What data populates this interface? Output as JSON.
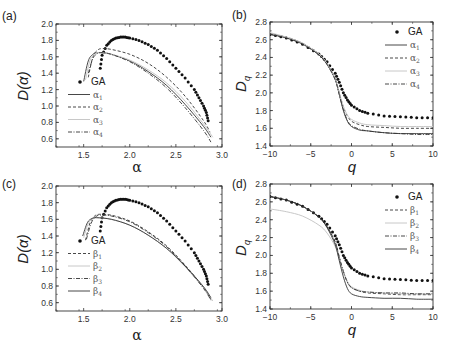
{
  "figure": {
    "panels": [
      {
        "id": "a",
        "label": "(a)",
        "ylabel": "D(α)",
        "xlabel": "α"
      },
      {
        "id": "b",
        "label": "(b)",
        "ylabel": "D",
        "ylabel_sub": "q",
        "xlabel": "q"
      },
      {
        "id": "c",
        "label": "(c)",
        "ylabel": "D(α)",
        "xlabel": "α"
      },
      {
        "id": "d",
        "label": "(d)",
        "ylabel": "D",
        "ylabel_sub": "q",
        "xlabel": "q"
      }
    ]
  },
  "chart_data": [
    {
      "panel": "(a)",
      "type": "line",
      "title": "",
      "xlabel": "α",
      "ylabel": "D(α)",
      "xlim": [
        1.2,
        3.0
      ],
      "ylim": [
        0.5,
        2.0
      ],
      "xticks": [
        "1.5",
        "2.0",
        "2.5",
        "3.0"
      ],
      "yticks": [
        "0.6",
        "0.8",
        "1.0",
        "1.2",
        "1.4",
        "1.6",
        "1.8",
        "2.0"
      ],
      "grid": false,
      "legend": [
        "GA",
        "α1",
        "α2",
        "α3",
        "α4"
      ],
      "legend_position": "lower left inside",
      "series": [
        {
          "name": "GA",
          "style": "dots",
          "x": [
            1.68,
            1.7,
            1.75,
            1.8,
            1.85,
            1.9,
            1.95,
            2.0,
            2.1,
            2.2,
            2.3,
            2.4,
            2.5,
            2.6,
            2.7,
            2.75,
            2.8,
            2.83,
            2.85
          ],
          "y": [
            1.46,
            1.62,
            1.74,
            1.8,
            1.83,
            1.84,
            1.84,
            1.83,
            1.8,
            1.75,
            1.68,
            1.58,
            1.46,
            1.34,
            1.2,
            1.1,
            1.0,
            0.92,
            0.82
          ]
        },
        {
          "name": "α1",
          "style": "solid",
          "x": [
            1.5,
            1.55,
            1.6,
            1.65,
            1.7,
            1.8,
            2.0,
            2.2,
            2.4,
            2.6,
            2.8,
            2.88
          ],
          "y": [
            1.3,
            1.55,
            1.63,
            1.65,
            1.65,
            1.63,
            1.55,
            1.42,
            1.25,
            1.02,
            0.75,
            0.62
          ]
        },
        {
          "name": "α2",
          "style": "dashed",
          "x": [
            1.55,
            1.6,
            1.65,
            1.7,
            1.8,
            2.0,
            2.2,
            2.4,
            2.6,
            2.8,
            2.87
          ],
          "y": [
            1.35,
            1.6,
            1.68,
            1.7,
            1.69,
            1.63,
            1.52,
            1.35,
            1.12,
            0.82,
            0.68
          ]
        },
        {
          "name": "α3",
          "style": "light-gray",
          "x": [
            1.52,
            1.57,
            1.62,
            1.67,
            1.8,
            2.0,
            2.2,
            2.4,
            2.6,
            2.8,
            2.9
          ],
          "y": [
            1.32,
            1.56,
            1.63,
            1.65,
            1.63,
            1.56,
            1.44,
            1.28,
            1.06,
            0.78,
            0.62
          ]
        },
        {
          "name": "α4",
          "style": "dash-dot",
          "x": [
            1.55,
            1.6,
            1.65,
            1.7,
            1.8,
            2.0,
            2.2,
            2.4,
            2.6,
            2.8,
            2.88
          ],
          "y": [
            1.4,
            1.58,
            1.64,
            1.65,
            1.63,
            1.54,
            1.4,
            1.22,
            0.98,
            0.7,
            0.56
          ]
        }
      ]
    },
    {
      "panel": "(b)",
      "type": "line",
      "title": "",
      "xlabel": "q",
      "ylabel": "Dq",
      "xlim": [
        -10,
        10
      ],
      "ylim": [
        1.4,
        2.8
      ],
      "xticks": [
        "−10",
        "−5",
        "0",
        "5",
        "10"
      ],
      "yticks": [
        "1.4",
        "1.6",
        "1.8",
        "2.0",
        "2.2",
        "2.4",
        "2.6",
        "2.8"
      ],
      "grid": false,
      "legend": [
        "GA",
        "α1",
        "α2",
        "α3",
        "α4"
      ],
      "legend_position": "upper right",
      "series": [
        {
          "name": "GA",
          "style": "dots",
          "x": [
            -10,
            -8,
            -6,
            -4,
            -3,
            -2,
            -1.5,
            -1,
            -0.5,
            0,
            1,
            2,
            4,
            6,
            8,
            10
          ],
          "y": [
            2.66,
            2.62,
            2.55,
            2.44,
            2.35,
            2.22,
            2.12,
            2.0,
            1.92,
            1.86,
            1.8,
            1.77,
            1.74,
            1.73,
            1.72,
            1.72
          ]
        },
        {
          "name": "α1",
          "style": "solid",
          "x": [
            -10,
            -8,
            -6,
            -4,
            -3,
            -2,
            -1.5,
            -1,
            -0.5,
            0,
            1,
            2,
            4,
            6,
            8,
            10
          ],
          "y": [
            2.66,
            2.62,
            2.55,
            2.43,
            2.32,
            2.15,
            1.98,
            1.8,
            1.68,
            1.62,
            1.58,
            1.57,
            1.55,
            1.54,
            1.54,
            1.54
          ]
        },
        {
          "name": "α2",
          "style": "dashed",
          "x": [
            -10,
            -8,
            -6,
            -4,
            -3,
            -2,
            -1.5,
            -1,
            -0.5,
            0,
            1,
            2,
            4,
            6,
            8,
            10
          ],
          "y": [
            2.67,
            2.63,
            2.56,
            2.44,
            2.33,
            2.16,
            2.0,
            1.84,
            1.74,
            1.68,
            1.64,
            1.62,
            1.61,
            1.6,
            1.6,
            1.6
          ]
        },
        {
          "name": "α3",
          "style": "light-gray",
          "x": [
            -10,
            -8,
            -6,
            -4,
            -3,
            -2,
            -1.5,
            -1,
            -0.5,
            0,
            1,
            2,
            4,
            6,
            8,
            10
          ],
          "y": [
            2.68,
            2.63,
            2.56,
            2.44,
            2.33,
            2.16,
            2.0,
            1.85,
            1.75,
            1.7,
            1.66,
            1.64,
            1.63,
            1.62,
            1.62,
            1.62
          ]
        },
        {
          "name": "α4",
          "style": "dash-dot",
          "x": [
            -10,
            -8,
            -6,
            -4,
            -3,
            -2,
            -1.5,
            -1,
            -0.5,
            0,
            1,
            2,
            4,
            6,
            8,
            10
          ],
          "y": [
            2.66,
            2.62,
            2.55,
            2.43,
            2.32,
            2.15,
            1.98,
            1.81,
            1.69,
            1.63,
            1.59,
            1.57,
            1.55,
            1.54,
            1.53,
            1.53
          ]
        }
      ]
    },
    {
      "panel": "(c)",
      "type": "line",
      "title": "",
      "xlabel": "α",
      "ylabel": "D(α)",
      "xlim": [
        1.2,
        3.0
      ],
      "ylim": [
        0.5,
        2.0
      ],
      "xticks": [
        "1.5",
        "2.0",
        "2.5",
        "3.0"
      ],
      "yticks": [
        "0.6",
        "0.8",
        "1.0",
        "1.2",
        "1.4",
        "1.6",
        "1.8",
        "2.0"
      ],
      "grid": false,
      "legend": [
        "GA",
        "β1",
        "β2",
        "β3",
        "β4"
      ],
      "legend_position": "lower left inside",
      "series": [
        {
          "name": "GA",
          "style": "dots",
          "x": [
            1.68,
            1.7,
            1.75,
            1.8,
            1.85,
            1.9,
            1.95,
            2.0,
            2.1,
            2.2,
            2.3,
            2.4,
            2.5,
            2.6,
            2.7,
            2.75,
            2.8,
            2.83,
            2.85
          ],
          "y": [
            1.46,
            1.62,
            1.74,
            1.8,
            1.83,
            1.84,
            1.84,
            1.83,
            1.8,
            1.75,
            1.68,
            1.58,
            1.46,
            1.34,
            1.2,
            1.1,
            1.0,
            0.92,
            0.82
          ]
        },
        {
          "name": "β1",
          "style": "dashed",
          "x": [
            1.52,
            1.57,
            1.62,
            1.67,
            1.8,
            2.0,
            2.2,
            2.4,
            2.6,
            2.8,
            2.88
          ],
          "y": [
            1.35,
            1.56,
            1.64,
            1.66,
            1.65,
            1.58,
            1.45,
            1.28,
            1.05,
            0.78,
            0.64
          ]
        },
        {
          "name": "β2",
          "style": "light-gray",
          "x": [
            1.5,
            1.55,
            1.6,
            1.65,
            1.8,
            2.0,
            2.2,
            2.4,
            2.6,
            2.8,
            2.9
          ],
          "y": [
            1.38,
            1.55,
            1.61,
            1.62,
            1.6,
            1.53,
            1.41,
            1.25,
            1.03,
            0.78,
            0.62
          ]
        },
        {
          "name": "β3",
          "style": "dash-dot",
          "x": [
            1.53,
            1.58,
            1.63,
            1.68,
            1.8,
            2.0,
            2.2,
            2.4,
            2.6,
            2.8,
            2.88
          ],
          "y": [
            1.36,
            1.55,
            1.63,
            1.65,
            1.64,
            1.57,
            1.44,
            1.27,
            1.04,
            0.77,
            0.63
          ]
        },
        {
          "name": "β4",
          "style": "solid",
          "x": [
            1.49,
            1.54,
            1.59,
            1.64,
            1.8,
            2.0,
            2.2,
            2.4,
            2.6,
            2.8,
            2.88
          ],
          "y": [
            1.4,
            1.56,
            1.61,
            1.62,
            1.6,
            1.53,
            1.41,
            1.25,
            1.04,
            0.79,
            0.66
          ]
        }
      ]
    },
    {
      "panel": "(d)",
      "type": "line",
      "title": "",
      "xlabel": "q",
      "ylabel": "Dq",
      "xlim": [
        -10,
        10
      ],
      "ylim": [
        1.4,
        2.8
      ],
      "xticks": [
        "−10",
        "−5",
        "0",
        "5",
        "10"
      ],
      "yticks": [
        "1.4",
        "1.6",
        "1.8",
        "2.0",
        "2.2",
        "2.4",
        "2.6",
        "2.8"
      ],
      "grid": false,
      "legend": [
        "GA",
        "β1",
        "β2",
        "β3",
        "β4"
      ],
      "legend_position": "upper right",
      "series": [
        {
          "name": "GA",
          "style": "dots",
          "x": [
            -10,
            -8,
            -6,
            -4,
            -3,
            -2,
            -1.5,
            -1,
            -0.5,
            0,
            1,
            2,
            4,
            6,
            8,
            10
          ],
          "y": [
            2.66,
            2.62,
            2.55,
            2.44,
            2.35,
            2.22,
            2.12,
            2.0,
            1.92,
            1.86,
            1.8,
            1.77,
            1.74,
            1.73,
            1.72,
            1.72
          ]
        },
        {
          "name": "β1",
          "style": "dashed",
          "x": [
            -10,
            -8,
            -6,
            -4,
            -3,
            -2,
            -1.5,
            -1,
            -0.5,
            0,
            1,
            2,
            4,
            6,
            8,
            10
          ],
          "y": [
            2.66,
            2.62,
            2.55,
            2.43,
            2.32,
            2.15,
            1.98,
            1.82,
            1.7,
            1.64,
            1.6,
            1.58,
            1.57,
            1.56,
            1.56,
            1.56
          ]
        },
        {
          "name": "β2",
          "style": "light-gray",
          "x": [
            -10,
            -8,
            -6,
            -4,
            -3,
            -2,
            -1.5,
            -1,
            -0.5,
            0,
            1,
            2,
            4,
            6,
            8,
            10
          ],
          "y": [
            2.52,
            2.49,
            2.44,
            2.34,
            2.25,
            2.1,
            1.96,
            1.82,
            1.71,
            1.65,
            1.61,
            1.59,
            1.58,
            1.57,
            1.57,
            1.57
          ]
        },
        {
          "name": "β3",
          "style": "dash-dot",
          "x": [
            -10,
            -8,
            -6,
            -4,
            -3,
            -2,
            -1.5,
            -1,
            -0.5,
            0,
            1,
            2,
            4,
            6,
            8,
            10
          ],
          "y": [
            2.66,
            2.62,
            2.55,
            2.43,
            2.32,
            2.15,
            1.98,
            1.82,
            1.7,
            1.64,
            1.6,
            1.59,
            1.58,
            1.58,
            1.57,
            1.57
          ]
        },
        {
          "name": "β4",
          "style": "solid",
          "x": [
            -10,
            -8,
            -6,
            -4,
            -3,
            -2,
            -1.5,
            -1,
            -0.5,
            0,
            1,
            2,
            4,
            6,
            8,
            10
          ],
          "y": [
            2.66,
            2.62,
            2.55,
            2.43,
            2.31,
            2.12,
            1.94,
            1.76,
            1.63,
            1.57,
            1.54,
            1.53,
            1.52,
            1.52,
            1.51,
            1.51
          ]
        }
      ]
    }
  ]
}
